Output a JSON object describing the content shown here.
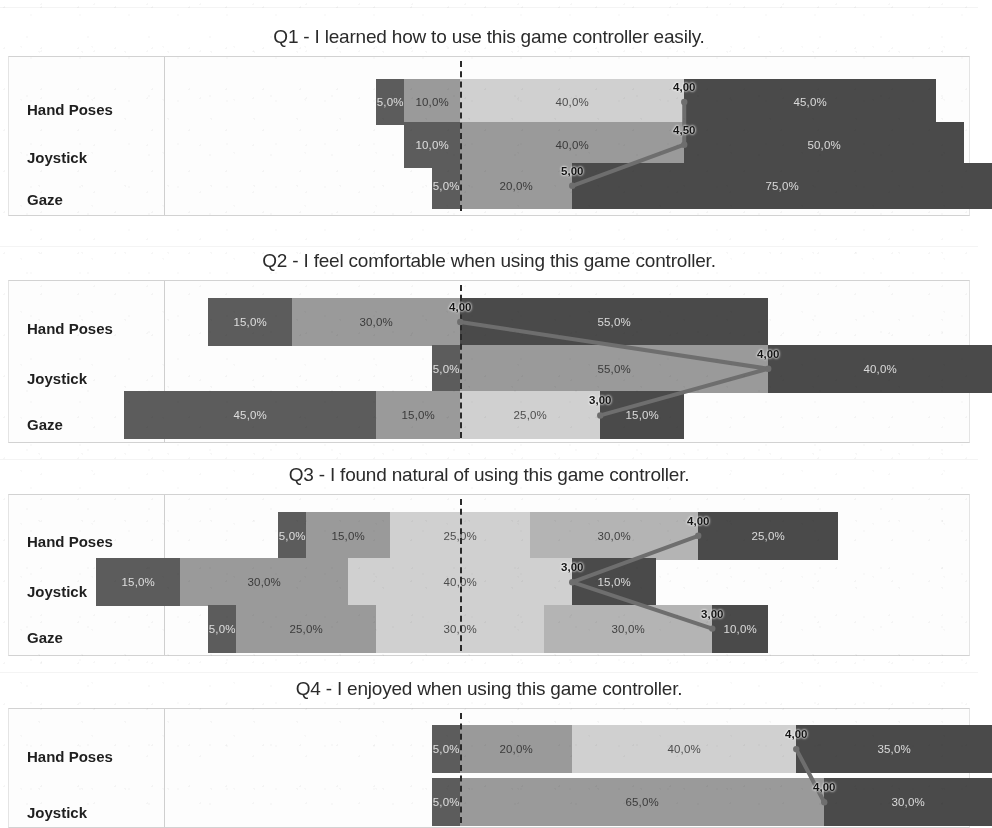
{
  "document": {
    "kind": "scanned-figure-page",
    "chart_count": 4
  },
  "categories": [
    "Hand Poses",
    "Joystick",
    "Gaze"
  ],
  "chart_data": [
    {
      "type": "bar",
      "subtype": "diverging-stacked-likert",
      "title": "Q1 - I learned how to use this game controller easily.",
      "xlabel": "",
      "ylabel": "",
      "categories": [
        "Hand Poses",
        "Joystick",
        "Gaze"
      ],
      "grid": false,
      "legend_position": "none",
      "series": [
        {
          "name": "Hand Poses",
          "values": [
            5.0,
            10.0,
            40.0,
            45.0
          ],
          "labels": [
            "5,0%",
            "10,0%",
            "40,0%",
            "45,0%"
          ],
          "median": "4,00",
          "negative_total": 15.0
        },
        {
          "name": "Joystick",
          "values": [
            10.0,
            40.0,
            50.0
          ],
          "labels": [
            "10,0%",
            "40,0%",
            "50,0%"
          ],
          "median": "4,50",
          "negative_total": 10.0
        },
        {
          "name": "Gaze",
          "values": [
            5.0,
            20.0,
            75.0
          ],
          "labels": [
            "5,0%",
            "20,0%",
            "75,0%"
          ],
          "median": "5,00",
          "negative_total": 5.0
        }
      ]
    },
    {
      "type": "bar",
      "subtype": "diverging-stacked-likert",
      "title": "Q2 - I feel comfortable when using this game controller.",
      "xlabel": "",
      "ylabel": "",
      "categories": [
        "Hand Poses",
        "Joystick",
        "Gaze"
      ],
      "grid": false,
      "legend_position": "none",
      "series": [
        {
          "name": "Hand Poses",
          "values": [
            15.0,
            30.0,
            55.0
          ],
          "labels": [
            "15,0%",
            "30,0%",
            "55,0%"
          ],
          "median": "4,00",
          "negative_total": 45.0
        },
        {
          "name": "Joystick",
          "values": [
            5.0,
            55.0,
            40.0
          ],
          "labels": [
            "5,0%",
            "55,0%",
            "40,0%"
          ],
          "median": "4,00",
          "negative_total": 5.0
        },
        {
          "name": "Gaze",
          "values": [
            45.0,
            15.0,
            25.0,
            15.0
          ],
          "labels": [
            "45,0%",
            "15,0%",
            "25,0%",
            "15,0%"
          ],
          "median": "3,00",
          "negative_total": 60.0
        }
      ]
    },
    {
      "type": "bar",
      "subtype": "diverging-stacked-likert",
      "title": "Q3 - I found natural of using this game controller.",
      "xlabel": "",
      "ylabel": "",
      "categories": [
        "Hand Poses",
        "Joystick",
        "Gaze"
      ],
      "grid": false,
      "legend_position": "none",
      "series": [
        {
          "name": "Hand Poses",
          "values": [
            5.0,
            15.0,
            25.0,
            30.0,
            25.0
          ],
          "labels": [
            "5,0%",
            "15,0%",
            "25,0%",
            "30,0%",
            "25,0%"
          ],
          "median": "4,00",
          "negative_total": 32.5
        },
        {
          "name": "Joystick",
          "values": [
            15.0,
            30.0,
            40.0,
            15.0
          ],
          "labels": [
            "15,0%",
            "30,0%",
            "40,0%",
            "15,0%"
          ],
          "median": "3,00",
          "negative_total": 65.0
        },
        {
          "name": "Gaze",
          "values": [
            5.0,
            25.0,
            30.0,
            30.0,
            10.0
          ],
          "labels": [
            "5,0%",
            "25,0%",
            "30,0%",
            "30,0%",
            "10,0%"
          ],
          "median": "3,00",
          "negative_total": 45.0
        }
      ]
    },
    {
      "type": "bar",
      "subtype": "diverging-stacked-likert",
      "title": "Q4 - I enjoyed when using this game controller.",
      "xlabel": "",
      "ylabel": "",
      "categories": [
        "Hand Poses",
        "Joystick"
      ],
      "grid": false,
      "legend_position": "none",
      "series": [
        {
          "name": "Hand Poses",
          "values": [
            5.0,
            20.0,
            40.0,
            35.0
          ],
          "labels": [
            "5,0%",
            "20,0%",
            "40,0%",
            "35,0%"
          ],
          "median": "4,00",
          "negative_total": 5.0
        },
        {
          "name": "Joystick",
          "values": [
            5.0,
            65.0,
            30.0
          ],
          "labels": [
            "5,0%",
            "65,0%",
            "30,0%"
          ],
          "median": "4,00",
          "negative_total": 5.0
        }
      ]
    }
  ],
  "colors": {
    "strongly_disagree": "#5c5c5c",
    "disagree": "#9a9a9a",
    "neutral": "#d0d0d0",
    "agree": "#b4b4b4",
    "strongly_agree": "#4a4a4a",
    "median_line": "#6e6e6e",
    "zero_line": "#2a2a2a",
    "frame": "#d2d2d2",
    "page_background": "#ffffff"
  }
}
